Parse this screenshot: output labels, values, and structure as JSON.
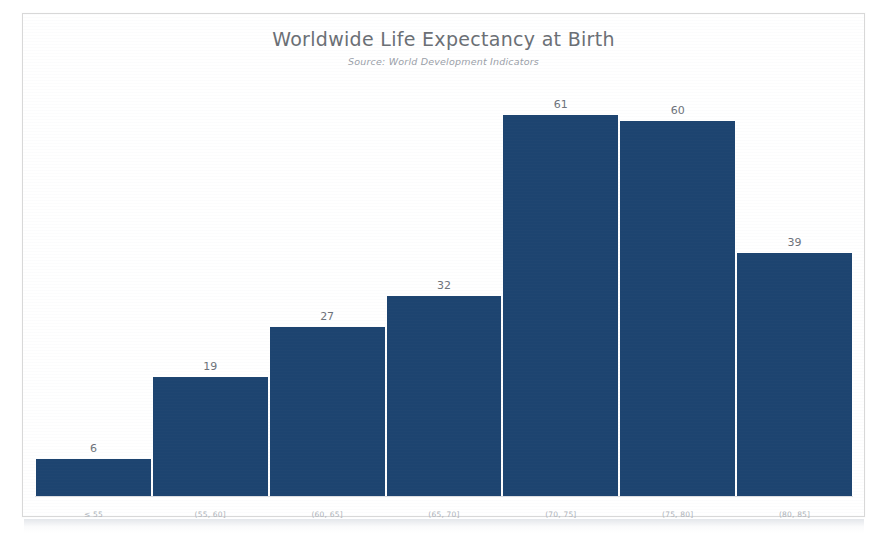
{
  "chart_data": {
    "type": "bar",
    "title": "Worldwide Life Expectancy at Birth",
    "subtitle": "Source: World Development Indicators",
    "xlabel": "",
    "ylabel": "",
    "grid": false,
    "legend": "none",
    "ylim": [
      0,
      66
    ],
    "categories": [
      "≤ 55",
      "(55, 60]",
      "(60, 65]",
      "(65, 70]",
      "(70, 75]",
      "(75, 80]",
      "(80, 85]"
    ],
    "values": [
      6,
      19,
      27,
      32,
      61,
      60,
      39
    ],
    "value_labels": [
      "6",
      "19",
      "27",
      "32",
      "61",
      "60",
      "39"
    ],
    "bar_color": "#1d4470",
    "bar_edge_color": "#ffffff",
    "title_color": "#6b6f75",
    "subtitle_color": "#9aa0a8",
    "label_color": "#6d727a",
    "tick_color": "#aeb3ba",
    "background_color": "#ffffff"
  }
}
